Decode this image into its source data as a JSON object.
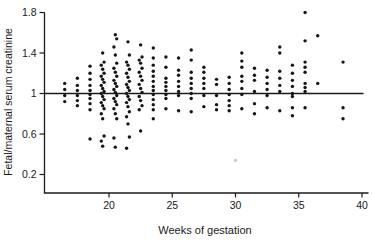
{
  "chart_data": {
    "type": "scatter",
    "title": "",
    "xlabel": "Weeks of gestation",
    "ylabel": "Fetal/maternal serum creatinine",
    "x_ticks": [
      20,
      25,
      30,
      35,
      40
    ],
    "y_ticks": [
      0.2,
      0.6,
      1,
      1.4,
      1.8
    ],
    "xlim": [
      15,
      40.5
    ],
    "ylim": [
      0,
      1.85
    ],
    "reference_line_y": 1,
    "grid": false,
    "legend_position": "none",
    "marker": {
      "shape": "circle",
      "color": "#161616",
      "radius_px": 1.7
    },
    "axis_color": "#1a1a1a",
    "background_color": "#ffffff",
    "series": [
      {
        "name": "fetal-maternal serum creatinine ratio",
        "points_by_week": [
          {
            "week": 17,
            "values": [
              1.1,
              1.04,
              0.98,
              0.92
            ]
          },
          {
            "week": 18,
            "values": [
              1.15,
              1.08,
              1.03,
              0.98,
              0.93,
              0.88
            ]
          },
          {
            "week": 19,
            "values": [
              1.27,
              1.2,
              1.14,
              1.08,
              1.03,
              0.99,
              0.95,
              0.9,
              0.84,
              0.55
            ]
          },
          {
            "week": 20,
            "values": [
              1.4,
              1.31,
              1.28,
              1.24,
              1.2,
              1.17,
              1.14,
              1.11,
              1.08,
              1.05,
              1.02,
              1.0,
              0.97,
              0.94,
              0.91,
              0.88,
              0.85,
              0.8,
              0.75,
              0.58,
              0.53,
              0.48
            ]
          },
          {
            "week": 21,
            "values": [
              1.58,
              1.54,
              1.46,
              1.38,
              1.3,
              1.25,
              1.21,
              1.17,
              1.13,
              1.1,
              1.07,
              1.04,
              1.01,
              0.98,
              0.95,
              0.92,
              0.89,
              0.85,
              0.8,
              0.75,
              0.56,
              0.47
            ]
          },
          {
            "week": 22,
            "values": [
              1.51,
              1.38,
              1.31,
              1.28,
              1.24,
              1.2,
              1.16,
              1.12,
              1.09,
              1.06,
              1.03,
              1.0,
              0.97,
              0.94,
              0.91,
              0.87,
              0.82,
              0.77,
              0.7,
              0.57,
              0.46
            ]
          },
          {
            "week": 23,
            "values": [
              1.48,
              1.36,
              1.33,
              1.3,
              1.25,
              1.21,
              1.17,
              1.13,
              1.09,
              1.05,
              1.01,
              0.97,
              0.93,
              0.88,
              0.84,
              0.63
            ]
          },
          {
            "week": 24,
            "values": [
              1.45,
              1.35,
              1.28,
              1.22,
              1.17,
              1.12,
              1.07,
              1.03,
              0.99,
              0.94,
              0.89,
              0.84,
              0.75
            ]
          },
          {
            "week": 25,
            "values": [
              1.36,
              1.26,
              1.15,
              1.11,
              1.07,
              1.03,
              0.99,
              0.95,
              0.85
            ]
          },
          {
            "week": 26,
            "values": [
              1.35,
              1.23,
              1.18,
              1.12,
              1.07,
              1.02,
              0.98,
              0.83
            ]
          },
          {
            "week": 27,
            "values": [
              1.43,
              1.33,
              1.21,
              1.15,
              1.1,
              1.05,
              1.0,
              0.95,
              0.82
            ]
          },
          {
            "week": 28,
            "values": [
              1.26,
              1.21,
              1.15,
              1.1,
              1.05,
              0.98,
              0.87
            ]
          },
          {
            "week": 29,
            "values": [
              1.14,
              1.09,
              0.98,
              0.89,
              0.84
            ]
          },
          {
            "week": 30,
            "values": [
              1.16,
              1.1,
              1.04,
              0.99,
              0.93,
              0.88,
              0.83
            ]
          },
          {
            "week": 31,
            "values": [
              1.4,
              1.32,
              1.26,
              1.17,
              1.12,
              1.05,
              0.99,
              0.85
            ]
          },
          {
            "week": 32,
            "values": [
              1.25,
              1.18,
              1.13,
              1.02,
              0.9,
              0.8
            ]
          },
          {
            "week": 33,
            "values": [
              1.23,
              1.16,
              1.1,
              1.04,
              0.98,
              0.86
            ]
          },
          {
            "week": 34,
            "values": [
              1.46,
              1.4,
              1.22,
              1.15,
              1.08,
              1.02,
              0.83
            ]
          },
          {
            "week": 35,
            "values": [
              1.28,
              1.2,
              1.13,
              1.07,
              1.0,
              0.97,
              0.86,
              0.78
            ]
          },
          {
            "week": 36,
            "values": [
              1.8,
              1.52,
              1.31,
              1.26,
              1.21,
              1.1,
              1.06,
              1.02,
              0.86
            ]
          },
          {
            "week": 37,
            "values": [
              1.57,
              1.1
            ]
          },
          {
            "week": 39,
            "values": [
              1.31,
              0.86,
              0.75
            ]
          }
        ]
      }
    ],
    "faint_points": [
      {
        "week": 30.5,
        "value": 0.34,
        "color": "#c9c9c9"
      }
    ]
  }
}
